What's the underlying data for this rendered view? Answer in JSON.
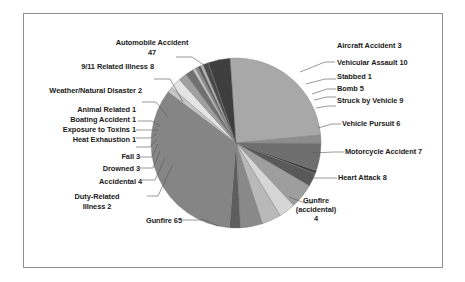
{
  "chart_data": {
    "type": "pie",
    "title": "",
    "subtitle": "",
    "xlabel": "",
    "ylabel": "",
    "legend_position": "none",
    "grid": false,
    "total": 187,
    "labels_show_value": true,
    "categories": [
      "Automobile Accident",
      "Aircraft Accident",
      "Vehicular Assault",
      "Stabbed",
      "Bomb",
      "Struck by Vehicle",
      "Vehicle Pursuit",
      "Motorcycle Accident",
      "Heart Attack",
      "Gunfire (accidental)",
      "Gunfire",
      "Duty-Related Illness",
      "Accidental",
      "Drowned",
      "Fall",
      "Heat Exhaustion",
      "Exposure to Toxins",
      "Boating Accident",
      "Animal Related",
      "Weather/Natural Disaster",
      "9/11 Related Illness"
    ],
    "values": [
      47,
      3,
      10,
      1,
      5,
      9,
      6,
      7,
      8,
      4,
      65,
      2,
      4,
      3,
      3,
      1,
      1,
      1,
      1,
      2,
      8
    ],
    "colors": [
      "#a8a8a8",
      "#8d8d8d",
      "#6e6e6e",
      "#3a3a3a",
      "#595959",
      "#9e9e9e",
      "#d6d6d6",
      "#b9b9b9",
      "#898989",
      "#5e5e5e",
      "#858585",
      "#c6c6c6",
      "#e4e4e4",
      "#a0a0a0",
      "#707070",
      "#c9c9c9",
      "#8a8a8a",
      "#5a5a5a",
      "#b5b5b5",
      "#4a4a4a",
      "#3e3e3e"
    ],
    "slice_labels": [
      "Automobile Accident\n47",
      "Aircraft Accident 3",
      "Vehicular Assault 10",
      "Stabbed 1",
      "Bomb 5",
      "Struck by Vehicle 9",
      "Vehicle Pursuit 6",
      "Motorcycle Accident 7",
      "Heart Attack 8",
      "Gunfire\n(accidental)\n4",
      "Gunfire 65",
      "Duty-Related\nIllness 2",
      "Accidental 4",
      "Drowned 3",
      "Fall 3",
      "Heat Exhaustion 1",
      "Exposure to Toxins 1",
      "Boating Accident 1",
      "Animal Related 1",
      "Weather/Natural Disaster 2",
      "9/11 Related Illness 8"
    ]
  },
  "labels": {
    "automobile_accident": "Automobile Accident",
    "automobile_accident_value": "47",
    "aircraft_accident": "Aircraft Accident 3",
    "vehicular_assault": "Vehicular Assault 10",
    "stabbed": "Stabbed 1",
    "bomb": "Bomb 5",
    "struck_by_vehicle": "Struck by Vehicle 9",
    "vehicle_pursuit": "Vehicle Pursuit 6",
    "motorcycle_accident": "Motorcycle Accident 7",
    "heart_attack": "Heart Attack 8",
    "gunfire_accidental_1": "Gunfire",
    "gunfire_accidental_2": "(accidental)",
    "gunfire_accidental_3": "4",
    "gunfire": "Gunfire 65",
    "duty_related_illness_1": "Duty-Related",
    "duty_related_illness_2": "Illness 2",
    "accidental": "Accidental 4",
    "drowned": "Drowned 3",
    "fall": "Fall 3",
    "heat_exhaustion": "Heat Exhaustion 1",
    "exposure_to_toxins": "Exposure to Toxins 1",
    "boating_accident": "Boating Accident 1",
    "animal_related": "Animal Related 1",
    "weather_natural_disaster": "Weather/Natural Disaster 2",
    "nine_eleven_related_illness": "9/11 Related Illness 8"
  },
  "style": {
    "background": "#ffffff",
    "frame_border": "#8e8e8e",
    "text_color": "#1a1a1a",
    "leader_line_color": "#555555"
  }
}
